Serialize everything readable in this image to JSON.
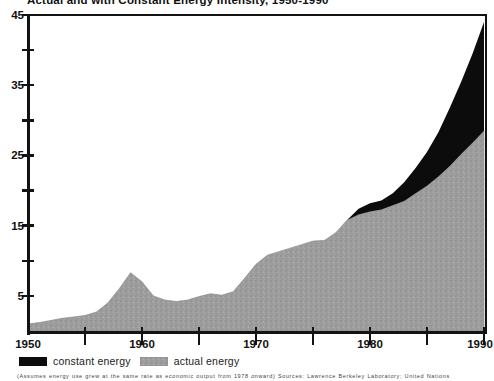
{
  "title": "Actual and with Constant Energy Intensity, 1950-1990",
  "footnote": "(Assumes energy use grew at the same rate as economic output from 1978 onward) Sources: Lawrence Berkeley Laboratory; United Nations",
  "legend": {
    "constant": {
      "label": "constant energy"
    },
    "actual": {
      "label": "actual energy"
    }
  },
  "colors": {
    "constant_area": "#0c0c0c",
    "actual_area_base": "#9d9d9d",
    "actual_area_speckle_dark": "#878787",
    "actual_area_speckle_light": "#b4b4b4",
    "axis": "#131313",
    "background": "#ffffff",
    "label_text": "#111111"
  },
  "chart_data": {
    "type": "area",
    "title": "Actual and with Constant Energy Intensity, 1950-1990",
    "x_start": 1950,
    "x_end": 1990,
    "x": [
      1950,
      1951,
      1952,
      1953,
      1954,
      1955,
      1956,
      1957,
      1958,
      1959,
      1960,
      1961,
      1962,
      1963,
      1964,
      1965,
      1966,
      1967,
      1968,
      1969,
      1970,
      1971,
      1972,
      1973,
      1974,
      1975,
      1976,
      1977,
      1978,
      1979,
      1980,
      1981,
      1982,
      1983,
      1984,
      1985,
      1986,
      1987,
      1988,
      1989,
      1990
    ],
    "series": [
      {
        "name": "actual energy",
        "style": "speckled-gray",
        "values": [
          1.0,
          1.2,
          1.5,
          1.8,
          2.0,
          2.2,
          2.7,
          4.0,
          6.0,
          8.3,
          7.0,
          5.0,
          4.4,
          4.2,
          4.4,
          4.9,
          5.3,
          5.1,
          5.6,
          7.5,
          9.5,
          10.8,
          11.3,
          11.8,
          12.3,
          12.8,
          12.9,
          14.0,
          15.8,
          16.6,
          17.0,
          17.3,
          17.9,
          18.5,
          19.6,
          20.7,
          22.0,
          23.5,
          25.2,
          26.8,
          28.5
        ]
      },
      {
        "name": "constant energy",
        "style": "black",
        "note": "total with constant energy intensity; equals actual through 1978, wedge drawn between this and actual",
        "values": [
          1.0,
          1.2,
          1.5,
          1.8,
          2.0,
          2.2,
          2.7,
          4.0,
          6.0,
          8.3,
          7.0,
          5.0,
          4.4,
          4.2,
          4.4,
          4.9,
          5.3,
          5.1,
          5.6,
          7.5,
          9.5,
          10.8,
          11.3,
          11.8,
          12.3,
          12.8,
          12.9,
          14.0,
          15.8,
          17.4,
          18.2,
          18.6,
          19.6,
          21.2,
          23.2,
          25.5,
          28.3,
          31.8,
          35.5,
          39.5,
          44.0
        ]
      }
    ],
    "ylim": [
      0,
      45
    ],
    "y_tick_step": 5,
    "y_labeled_ticks": [
      5,
      15,
      25,
      35,
      45
    ],
    "x_tick_labels": [
      "1950",
      "1960",
      "1970",
      "1980",
      "1990"
    ],
    "x_minor_tick_step": 5,
    "grid": false,
    "legend_position": "bottom-left",
    "xlabel": "",
    "ylabel": ""
  }
}
